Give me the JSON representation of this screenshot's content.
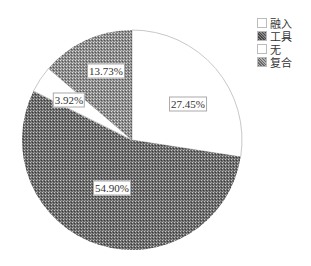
{
  "chart_data": {
    "type": "pie",
    "title": "",
    "categories": [
      "融入",
      "工具",
      "无",
      "复合"
    ],
    "values": [
      27.45,
      54.9,
      3.92,
      13.73
    ],
    "labels": [
      "27.45%",
      "54.90%",
      "3.92%",
      "13.73%"
    ],
    "fills": [
      "white",
      "dark-hatch",
      "white",
      "medium-hatch"
    ],
    "start_angle": "12 o'clock",
    "direction": "clockwise",
    "legend_position": "top-right"
  },
  "legend": {
    "items": [
      {
        "label": "融入",
        "fill": "white"
      },
      {
        "label": "工具",
        "fill": "dark-hatch"
      },
      {
        "label": "无",
        "fill": "white"
      },
      {
        "label": "复合",
        "fill": "medium-hatch"
      }
    ]
  },
  "slice_labels": {
    "rongru": "27.45%",
    "gongju": "54.90%",
    "wu": "3.92%",
    "fuhe": "13.73%"
  }
}
